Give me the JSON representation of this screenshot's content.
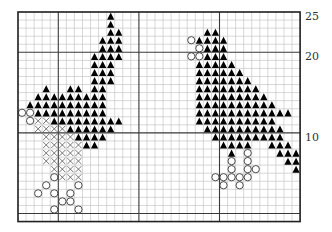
{
  "chart": {
    "cols": 35,
    "rows": 26,
    "origin_x": 18,
    "origin_y": 12,
    "cell": 8.06,
    "major_every": 10,
    "major_col_offset": 5,
    "major_row_offset": 5,
    "colors": {
      "grid_minor": "#bdbdbd",
      "grid_major": "#3a3a3a",
      "border": "#222222",
      "triangle": "#000000",
      "circle_stroke": "#222222",
      "cross": "#555555"
    },
    "row_labels": [
      {
        "text": "25",
        "row": 0
      },
      {
        "text": "20",
        "row": 5
      },
      {
        "text": "10",
        "row": 15
      }
    ],
    "legend": [
      {
        "symbol": "triangle",
        "name": "filled-triangle-stitch"
      },
      {
        "symbol": "circle",
        "name": "open-circle-stitch"
      },
      {
        "symbol": "cross",
        "name": "cross-stitch"
      }
    ]
  },
  "chart_data": {
    "type": "heatmap",
    "title": "",
    "xlabel": "",
    "ylabel": "",
    "row_axis_labels": {
      "25": 0,
      "20": 5,
      "10": 15
    },
    "grid": {
      "cols": 35,
      "rows": 26
    },
    "cells": {
      "triangle": [
        [
          0,
          [
            11
          ]
        ],
        [
          1,
          [
            11
          ]
        ],
        [
          2,
          [
            11,
            12
          ]
        ],
        [
          3,
          [
            10,
            11,
            12
          ]
        ],
        [
          4,
          [
            10,
            11,
            12
          ]
        ],
        [
          5,
          [
            9,
            10,
            11,
            12
          ]
        ],
        [
          6,
          [
            9,
            10,
            11
          ]
        ],
        [
          7,
          [
            9,
            10,
            11
          ]
        ],
        [
          8,
          [
            9,
            10,
            11
          ]
        ],
        [
          9,
          [
            3,
            6,
            7,
            9,
            10
          ]
        ],
        [
          10,
          [
            2,
            3,
            4,
            5,
            6,
            7,
            8,
            9,
            10
          ]
        ],
        [
          11,
          [
            1,
            2,
            3,
            4,
            5,
            6,
            7,
            8,
            9,
            10
          ]
        ],
        [
          12,
          [
            2,
            3,
            4,
            5,
            6,
            7,
            8,
            9,
            10
          ]
        ],
        [
          13,
          [
            4,
            5,
            6,
            7,
            8,
            9,
            10,
            11,
            12
          ]
        ],
        [
          14,
          [
            6,
            7,
            8,
            9,
            10,
            11
          ]
        ],
        [
          15,
          [
            7,
            8,
            9,
            10
          ]
        ],
        [
          16,
          [
            8,
            9
          ]
        ],
        [
          2,
          [
            23,
            24
          ]
        ],
        [
          3,
          [
            22,
            23,
            24,
            25
          ]
        ],
        [
          4,
          [
            23,
            24,
            25
          ]
        ],
        [
          5,
          [
            23,
            24,
            25
          ]
        ],
        [
          6,
          [
            22,
            23,
            24,
            25,
            26
          ]
        ],
        [
          7,
          [
            22,
            23,
            24,
            25,
            26,
            27
          ]
        ],
        [
          8,
          [
            22,
            23,
            24,
            25,
            26,
            27,
            28
          ]
        ],
        [
          9,
          [
            22,
            23,
            24,
            25,
            26,
            27,
            28,
            29
          ]
        ],
        [
          10,
          [
            22,
            23,
            24,
            25,
            26,
            27,
            28,
            29,
            30
          ]
        ],
        [
          11,
          [
            22,
            23,
            24,
            25,
            26,
            27,
            28,
            29,
            30,
            31
          ]
        ],
        [
          12,
          [
            22,
            23,
            24,
            25,
            26,
            27,
            28,
            29,
            30,
            31,
            32,
            33
          ]
        ],
        [
          13,
          [
            22,
            23,
            24,
            25,
            26,
            27,
            28,
            29,
            30,
            31
          ]
        ],
        [
          14,
          [
            23,
            24,
            25,
            26,
            27,
            28,
            29,
            30,
            31,
            32
          ]
        ],
        [
          15,
          [
            24,
            25,
            26,
            27,
            28,
            29,
            30,
            31,
            32
          ]
        ],
        [
          16,
          [
            25,
            26,
            27,
            28,
            31,
            32,
            33
          ]
        ],
        [
          17,
          [
            26,
            32,
            33,
            34
          ]
        ],
        [
          18,
          [
            33,
            34
          ]
        ],
        [
          19,
          [
            34
          ]
        ]
      ],
      "circle": [
        [
          12,
          [
            0,
            1
          ]
        ],
        [
          13,
          [
            1
          ]
        ],
        [
          20,
          [
            4
          ]
        ],
        [
          21,
          [
            3,
            7
          ]
        ],
        [
          22,
          [
            2,
            4,
            6
          ]
        ],
        [
          23,
          [
            5,
            6
          ]
        ],
        [
          24,
          [
            4,
            7
          ]
        ],
        [
          3,
          [
            21
          ]
        ],
        [
          4,
          [
            22
          ]
        ],
        [
          5,
          [
            21,
            22
          ]
        ],
        [
          17,
          [
            28
          ]
        ],
        [
          18,
          [
            26,
            28
          ]
        ],
        [
          19,
          [
            26,
            28,
            29
          ]
        ],
        [
          20,
          [
            24,
            25,
            26,
            27,
            28
          ]
        ],
        [
          21,
          [
            25,
            27
          ]
        ]
      ],
      "cross": [
        [
          13,
          [
            2,
            3
          ]
        ],
        [
          14,
          [
            2,
            3,
            4,
            5
          ]
        ],
        [
          15,
          [
            3,
            4,
            5,
            6
          ]
        ],
        [
          16,
          [
            3,
            4,
            5,
            6,
            7
          ]
        ],
        [
          17,
          [
            3,
            4,
            5,
            6,
            7
          ]
        ],
        [
          18,
          [
            3,
            4,
            5,
            6,
            7
          ]
        ],
        [
          19,
          [
            4,
            5,
            6,
            7
          ]
        ],
        [
          20,
          [
            5,
            6,
            7
          ]
        ]
      ]
    }
  }
}
